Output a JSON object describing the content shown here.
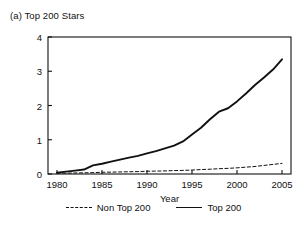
{
  "panel": {
    "title": "(a) Top 200 Stars"
  },
  "chart_data": {
    "type": "line",
    "title": "(a) Top 200 Stars",
    "xlabel": "Year",
    "ylabel": "",
    "xlim": [
      1979,
      2006
    ],
    "ylim": [
      0,
      4
    ],
    "xticks": [
      1980,
      1985,
      1990,
      1995,
      2000,
      2005
    ],
    "xtick_labels": [
      "1980",
      "1985",
      "1990",
      "1995",
      "2000",
      "2005"
    ],
    "yticks": [
      0,
      1,
      2,
      3,
      4
    ],
    "ytick_labels": [
      "0",
      "1",
      "2",
      "3",
      "4"
    ],
    "grid": false,
    "legend_position": "below-axis-center",
    "frame": "full-box",
    "x": [
      1980,
      1981,
      1982,
      1983,
      1984,
      1985,
      1986,
      1987,
      1988,
      1989,
      1990,
      1991,
      1992,
      1993,
      1994,
      1995,
      1996,
      1997,
      1998,
      1999,
      2000,
      2001,
      2002,
      2003,
      2004,
      2005
    ],
    "series": [
      {
        "name": "Top 200",
        "style": "solid",
        "color": "#111111",
        "values": [
          0.04,
          0.07,
          0.1,
          0.13,
          0.25,
          0.3,
          0.36,
          0.42,
          0.48,
          0.53,
          0.6,
          0.67,
          0.75,
          0.83,
          0.95,
          1.15,
          1.35,
          1.6,
          1.82,
          1.92,
          2.12,
          2.35,
          2.6,
          2.82,
          3.05,
          3.35
        ]
      },
      {
        "name": "Non Top 200",
        "style": "dashed",
        "color": "#111111",
        "values": [
          0.02,
          0.025,
          0.03,
          0.035,
          0.04,
          0.05,
          0.055,
          0.06,
          0.065,
          0.07,
          0.08,
          0.085,
          0.09,
          0.1,
          0.105,
          0.115,
          0.13,
          0.14,
          0.155,
          0.165,
          0.18,
          0.2,
          0.22,
          0.25,
          0.28,
          0.31
        ]
      }
    ]
  },
  "legend": {
    "entries": [
      {
        "label": "Non Top 200",
        "style": "dashed"
      },
      {
        "label": "Top 200",
        "style": "solid"
      }
    ]
  },
  "colors": {
    "line": "#111111",
    "frame": "#111111",
    "background": "#ffffff"
  }
}
